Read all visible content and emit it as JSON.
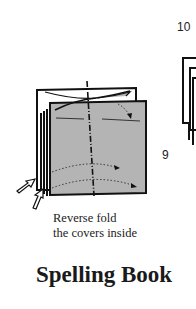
{
  "steps": {
    "step_9": "9",
    "step_10": "10"
  },
  "instruction": {
    "line1": "Reverse fold",
    "line2": "the covers inside"
  },
  "title": "Spelling Book",
  "colors": {
    "paper_fill": "#b4b4b4",
    "line": "#111111"
  }
}
